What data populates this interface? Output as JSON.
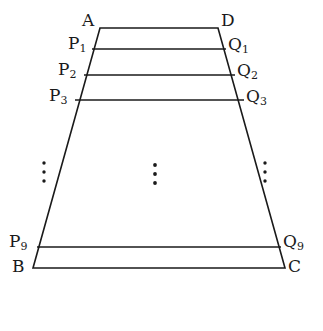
{
  "figure": {
    "type": "geometry-diagram",
    "shape": "trapezoid",
    "background_color": "#ffffff",
    "stroke_color": "#1a1a1a",
    "stroke_width": 1.6,
    "width": 323,
    "height": 331,
    "vertices": {
      "A": {
        "label": "A",
        "x": 100,
        "y": 28
      },
      "D": {
        "label": "D",
        "x": 218,
        "y": 28
      },
      "B": {
        "label": "B",
        "x": 33,
        "y": 268
      },
      "C": {
        "label": "C",
        "x": 285,
        "y": 268
      }
    },
    "labels": {
      "A": {
        "base": "A",
        "sub": ""
      },
      "D": {
        "base": "D",
        "sub": ""
      },
      "B": {
        "base": "B",
        "sub": ""
      },
      "C": {
        "base": "C",
        "sub": ""
      },
      "P1": {
        "base": "P",
        "sub": "1"
      },
      "P2": {
        "base": "P",
        "sub": "2"
      },
      "P3": {
        "base": "P",
        "sub": "3"
      },
      "P9": {
        "base": "P",
        "sub": "9"
      },
      "Q1": {
        "base": "Q",
        "sub": "1"
      },
      "Q2": {
        "base": "Q",
        "sub": "2"
      },
      "Q3": {
        "base": "Q",
        "sub": "3"
      },
      "Q9": {
        "base": "Q",
        "sub": "9"
      }
    },
    "edges": [
      {
        "name": "top-edge-AD",
        "from": "A",
        "to": "D"
      },
      {
        "name": "left-edge-AB",
        "from": "A",
        "to": "B"
      },
      {
        "name": "right-edge-DC",
        "from": "D",
        "to": "C"
      },
      {
        "name": "bottom-edge-BC",
        "from": "B",
        "to": "C"
      }
    ],
    "cross_segments": [
      {
        "name": "segment-P1Q1",
        "left": "P1",
        "right": "Q1",
        "x1": 92,
        "y1": 49,
        "x2": 226,
        "y2": 49
      },
      {
        "name": "segment-P2Q2",
        "left": "P2",
        "right": "Q2",
        "x1": 84,
        "y1": 75,
        "x2": 235,
        "y2": 75
      },
      {
        "name": "segment-P3Q3",
        "left": "P3",
        "right": "Q3",
        "x1": 75,
        "y1": 100,
        "x2": 244,
        "y2": 100
      },
      {
        "name": "segment-P9Q9",
        "left": "P9",
        "right": "Q9",
        "x1": 37,
        "y1": 247,
        "x2": 281,
        "y2": 247
      }
    ],
    "ellipses": [
      {
        "name": "ellipsis-left",
        "x": 44,
        "dots_y": [
          163,
          172,
          181
        ]
      },
      {
        "name": "ellipsis-center",
        "x": 155,
        "dots_y": [
          165,
          174,
          183
        ]
      },
      {
        "name": "ellipsis-right",
        "x": 265,
        "dots_y": [
          163,
          172,
          181
        ]
      }
    ]
  }
}
